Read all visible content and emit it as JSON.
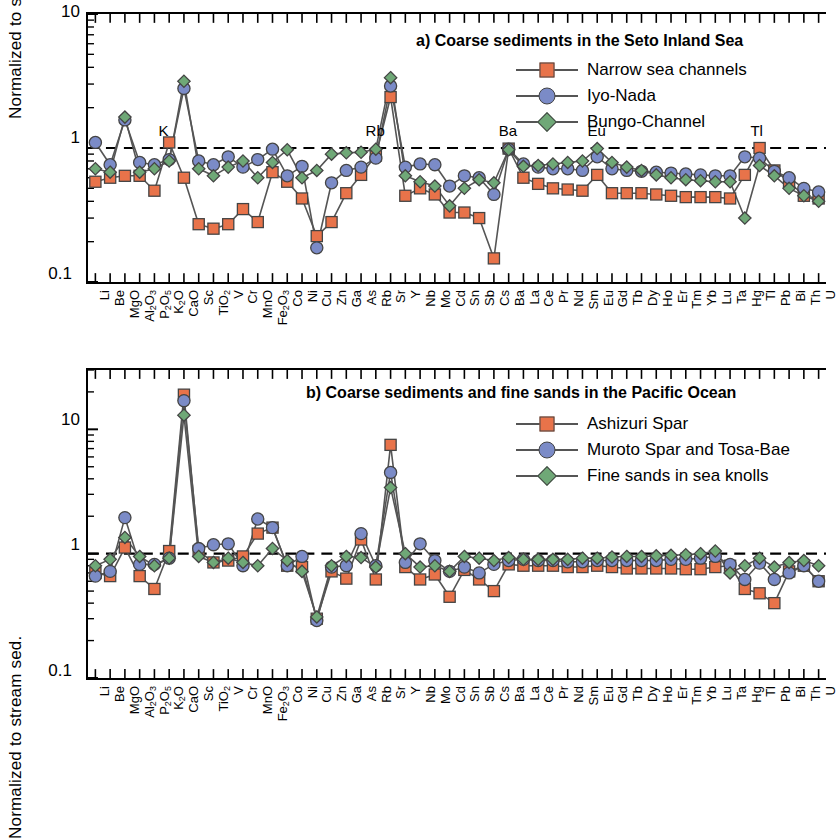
{
  "figure": {
    "width": 826,
    "height": 758,
    "background": "#ffffff"
  },
  "colors": {
    "series1": "#E8734A",
    "series2": "#7B8BC7",
    "series3": "#6FA877",
    "marker_edge": "#444444",
    "line": "#555555",
    "axis": "#000000",
    "reference_line": "#000000"
  },
  "elements": [
    "Li",
    "Be",
    "MgO",
    "Al2O3",
    "P2O5",
    "K2O",
    "CaO",
    "Sc",
    "TiO2",
    "V",
    "Cr",
    "MnO",
    "Fe2O3",
    "Co",
    "Ni",
    "Cu",
    "Zn",
    "Ga",
    "As",
    "Rb",
    "Sr",
    "Y",
    "Nb",
    "Mo",
    "Cd",
    "Sn",
    "Sb",
    "Cs",
    "Ba",
    "La",
    "Ce",
    "Pr",
    "Nd",
    "Sm",
    "Eu",
    "Gd",
    "Tb",
    "Dy",
    "Ho",
    "Er",
    "Tm",
    "Yb",
    "Lu",
    "Ta",
    "Hg",
    "Tl",
    "Pb",
    "Bi",
    "Th",
    "U"
  ],
  "element_labels": [
    {
      "t": "Li"
    },
    {
      "t": "Be"
    },
    {
      "t": "MgO"
    },
    {
      "t": "Al",
      "sub": "2",
      "t2": "O",
      "sub2": "3"
    },
    {
      "t": "P",
      "sub": "2",
      "t2": "O",
      "sub2": "5"
    },
    {
      "t": "K",
      "sub": "2",
      "t2": "O"
    },
    {
      "t": "CaO"
    },
    {
      "t": "Sc"
    },
    {
      "t": "TiO",
      "sub": "2"
    },
    {
      "t": "V"
    },
    {
      "t": "Cr"
    },
    {
      "t": "MnO"
    },
    {
      "t": "Fe",
      "sub": "2",
      "t2": "O",
      "sub2": "3"
    },
    {
      "t": "Co"
    },
    {
      "t": "Ni"
    },
    {
      "t": "Cu"
    },
    {
      "t": "Zn"
    },
    {
      "t": "Ga"
    },
    {
      "t": "As"
    },
    {
      "t": "Rb"
    },
    {
      "t": "Sr"
    },
    {
      "t": "Y"
    },
    {
      "t": "Nb"
    },
    {
      "t": "Mo"
    },
    {
      "t": "Cd"
    },
    {
      "t": "Sn"
    },
    {
      "t": "Sb"
    },
    {
      "t": "Cs"
    },
    {
      "t": "Ba"
    },
    {
      "t": "La"
    },
    {
      "t": "Ce"
    },
    {
      "t": "Pr"
    },
    {
      "t": "Nd"
    },
    {
      "t": "Sm"
    },
    {
      "t": "Eu"
    },
    {
      "t": "Gd"
    },
    {
      "t": "Tb"
    },
    {
      "t": "Dy"
    },
    {
      "t": "Ho"
    },
    {
      "t": "Er"
    },
    {
      "t": "Tm"
    },
    {
      "t": "Yb"
    },
    {
      "t": "Lu"
    },
    {
      "t": "Ta"
    },
    {
      "t": "Hg"
    },
    {
      "t": "Tl"
    },
    {
      "t": "Pb"
    },
    {
      "t": "Bi"
    },
    {
      "t": "Th"
    },
    {
      "t": "U"
    }
  ],
  "panel_a": {
    "title": "a) Coarse sediments in the Seto Inland Sea",
    "ylabel": "Normalized to stream sed.",
    "ytick_labels": [
      "10",
      "1",
      "0.1"
    ],
    "annotations": [
      {
        "label": "K",
        "element": "K2O"
      },
      {
        "label": "Rb",
        "element": "Rb"
      },
      {
        "label": "Ba",
        "element": "Ba"
      },
      {
        "label": "Eu",
        "element": "Eu"
      },
      {
        "label": "Tl",
        "element": "Tl"
      }
    ],
    "legend": [
      {
        "label": "Narrow sea channels",
        "marker": "square",
        "color": "#E8734A"
      },
      {
        "label": "Iyo-Nada",
        "marker": "circle",
        "color": "#7B8BC7"
      },
      {
        "label": "Bungo-Channel",
        "marker": "diamond",
        "color": "#6FA877"
      }
    ]
  },
  "panel_b": {
    "title": "b) Coarse sediments and fine sands in the Pacific Ocean",
    "ylabel": "Normalized to stream sed.",
    "ytick_labels": [
      "10",
      "1",
      "0.1"
    ],
    "legend": [
      {
        "label": "Ashizuri Spar",
        "marker": "square",
        "color": "#E8734A"
      },
      {
        "label": "Muroto Spar and Tosa-Bae",
        "marker": "circle",
        "color": "#7B8BC7"
      },
      {
        "label": "Fine sands in sea knolls",
        "marker": "diamond",
        "color": "#6FA877"
      }
    ]
  },
  "chart_data": [
    {
      "type": "line",
      "panel": "a",
      "title": "a) Coarse sediments in the Seto Inland Sea",
      "xlabel": "",
      "ylabel": "Normalized to stream sed.",
      "yscale": "log",
      "ylim": [
        0.1,
        10
      ],
      "yticks": [
        0.1,
        1,
        10
      ],
      "grid": false,
      "legend_position": "top-right",
      "reference_line": {
        "y": 1.0,
        "style": "dashed"
      },
      "categories": [
        "Li",
        "Be",
        "MgO",
        "Al2O3",
        "P2O5",
        "K2O",
        "CaO",
        "Sc",
        "TiO2",
        "V",
        "Cr",
        "MnO",
        "Fe2O3",
        "Co",
        "Ni",
        "Cu",
        "Zn",
        "Ga",
        "As",
        "Rb",
        "Sr",
        "Y",
        "Nb",
        "Mo",
        "Cd",
        "Sn",
        "Sb",
        "Cs",
        "Ba",
        "La",
        "Ce",
        "Pr",
        "Nd",
        "Sm",
        "Eu",
        "Gd",
        "Tb",
        "Dy",
        "Ho",
        "Er",
        "Tm",
        "Yb",
        "Lu",
        "Ta",
        "Hg",
        "Tl",
        "Pb",
        "Bi",
        "Th",
        "U"
      ],
      "series": [
        {
          "name": "Narrow sea channels",
          "marker": "square",
          "color": "#E8734A",
          "values": [
            0.56,
            0.6,
            0.62,
            0.62,
            0.48,
            1.1,
            0.6,
            0.27,
            0.25,
            0.27,
            0.35,
            0.28,
            0.66,
            0.56,
            0.42,
            0.22,
            0.28,
            0.46,
            0.63,
            0.88,
            2.4,
            0.44,
            0.5,
            0.45,
            0.33,
            0.33,
            0.3,
            0.15,
            0.99,
            0.6,
            0.54,
            0.5,
            0.49,
            0.48,
            0.63,
            0.46,
            0.46,
            0.46,
            0.45,
            0.44,
            0.43,
            0.43,
            0.43,
            0.42,
            0.63,
            1.0,
            0.68,
            0.56,
            0.44,
            0.42
          ]
        },
        {
          "name": "Iyo-Nada",
          "marker": "circle",
          "color": "#7B8BC7",
          "values": [
            1.1,
            0.75,
            1.62,
            0.78,
            0.75,
            0.82,
            2.78,
            0.8,
            0.75,
            0.86,
            0.72,
            0.82,
            0.98,
            0.62,
            0.73,
            0.18,
            0.55,
            0.68,
            0.72,
            0.84,
            2.9,
            0.72,
            0.76,
            0.75,
            0.52,
            0.62,
            0.6,
            0.45,
            0.98,
            0.76,
            0.72,
            0.7,
            0.7,
            0.68,
            0.86,
            0.7,
            0.68,
            0.67,
            0.66,
            0.65,
            0.64,
            0.63,
            0.62,
            0.62,
            0.86,
            0.84,
            0.67,
            0.6,
            0.5,
            0.47
          ]
        },
        {
          "name": "Bungo-Channel",
          "marker": "diamond",
          "color": "#6FA877",
          "values": [
            0.7,
            0.66,
            1.7,
            0.66,
            0.7,
            0.8,
            3.15,
            0.7,
            0.62,
            0.72,
            0.8,
            0.6,
            0.78,
            0.97,
            0.6,
            0.68,
            0.9,
            0.92,
            0.93,
            0.98,
            3.35,
            0.62,
            0.56,
            0.52,
            0.37,
            0.5,
            0.58,
            0.55,
            0.97,
            0.73,
            0.74,
            0.76,
            0.78,
            0.8,
            0.99,
            0.78,
            0.72,
            0.68,
            0.63,
            0.6,
            0.58,
            0.57,
            0.56,
            0.56,
            0.3,
            0.74,
            0.62,
            0.5,
            0.44,
            0.4
          ]
        }
      ]
    },
    {
      "type": "line",
      "panel": "b",
      "title": "b) Coarse sediments and fine sands in the Pacific Ocean",
      "xlabel": "",
      "ylabel": "Normalized to stream sed.",
      "yscale": "log",
      "ylim": [
        0.1,
        30
      ],
      "yticks": [
        0.1,
        1,
        10
      ],
      "grid": false,
      "legend_position": "top-right",
      "reference_line": {
        "y": 1.0,
        "style": "dashed"
      },
      "categories": [
        "Li",
        "Be",
        "MgO",
        "Al2O3",
        "P2O5",
        "K2O",
        "CaO",
        "Sc",
        "TiO2",
        "V",
        "Cr",
        "MnO",
        "Fe2O3",
        "Co",
        "Ni",
        "Cu",
        "Zn",
        "Ga",
        "As",
        "Rb",
        "Sr",
        "Y",
        "Nb",
        "Mo",
        "Cd",
        "Sn",
        "Sb",
        "Cs",
        "Ba",
        "La",
        "Ce",
        "Pr",
        "Nd",
        "Sm",
        "Eu",
        "Gd",
        "Tb",
        "Dy",
        "Ho",
        "Er",
        "Tm",
        "Yb",
        "Lu",
        "Ta",
        "Hg",
        "Tl",
        "Pb",
        "Bi",
        "Th",
        "U"
      ],
      "series": [
        {
          "name": "Ashizuri Spar",
          "marker": "square",
          "color": "#E8734A",
          "values": [
            0.7,
            0.66,
            1.12,
            0.66,
            0.52,
            1.05,
            19.0,
            1.05,
            0.85,
            0.88,
            0.95,
            1.45,
            1.62,
            0.8,
            0.78,
            0.3,
            0.72,
            0.63,
            1.3,
            0.62,
            7.5,
            0.78,
            0.62,
            0.68,
            0.45,
            0.74,
            0.62,
            0.5,
            0.82,
            0.8,
            0.8,
            0.8,
            0.78,
            0.78,
            0.8,
            0.78,
            0.76,
            0.76,
            0.76,
            0.76,
            0.75,
            0.75,
            0.78,
            0.8,
            0.52,
            0.48,
            0.4,
            0.72,
            0.8,
            0.6
          ]
        },
        {
          "name": "Muroto Spar and Tosa-Bae",
          "marker": "circle",
          "color": "#7B8BC7",
          "values": [
            0.66,
            0.72,
            1.95,
            0.82,
            0.82,
            0.92,
            17.0,
            1.1,
            1.18,
            1.2,
            0.8,
            1.9,
            1.62,
            0.8,
            0.95,
            0.29,
            0.78,
            0.8,
            1.45,
            0.8,
            4.5,
            0.85,
            1.2,
            0.88,
            0.72,
            0.78,
            0.7,
            0.82,
            0.88,
            0.9,
            0.88,
            0.88,
            0.86,
            0.86,
            0.88,
            0.88,
            0.88,
            0.88,
            0.88,
            0.9,
            0.9,
            0.92,
            0.95,
            0.82,
            0.62,
            0.84,
            0.62,
            0.7,
            0.8,
            0.6
          ]
        },
        {
          "name": "Fine sands in sea knolls",
          "marker": "diamond",
          "color": "#6FA877",
          "values": [
            0.8,
            0.9,
            1.35,
            0.95,
            0.8,
            0.92,
            13.0,
            0.95,
            0.85,
            0.92,
            0.85,
            0.8,
            1.1,
            0.88,
            0.72,
            0.31,
            0.8,
            0.95,
            0.93,
            0.78,
            3.4,
            1.0,
            0.78,
            0.8,
            0.72,
            0.95,
            0.92,
            0.88,
            0.93,
            0.9,
            0.9,
            0.9,
            0.9,
            0.92,
            0.92,
            0.94,
            0.95,
            0.95,
            0.96,
            0.97,
            0.98,
            1.0,
            1.05,
            0.7,
            0.8,
            0.92,
            0.78,
            0.85,
            0.88,
            0.8
          ]
        }
      ]
    }
  ]
}
